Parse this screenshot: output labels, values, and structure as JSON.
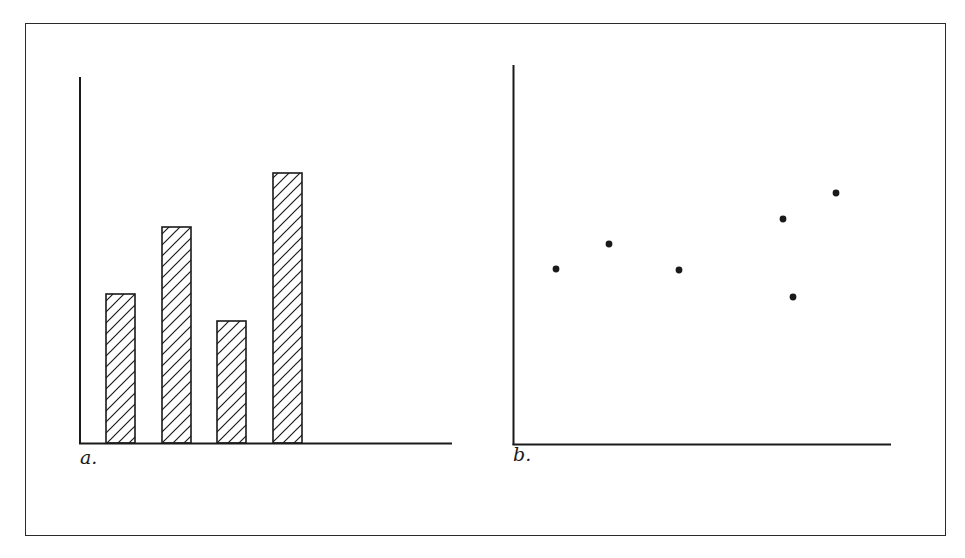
{
  "figure": {
    "panels": [
      {
        "id": "a",
        "label": "a."
      },
      {
        "id": "b",
        "label": "b."
      }
    ]
  },
  "chart_data": [
    {
      "type": "bar",
      "panel": "a.",
      "title": "",
      "xlabel": "",
      "ylabel": "",
      "categories": [
        "1",
        "2",
        "3",
        "4"
      ],
      "values": [
        149,
        216,
        122,
        270
      ],
      "units": "relative height (no axis ticks or labels shown)",
      "fill": "diagonal hatch",
      "grid": false,
      "legend": null
    },
    {
      "type": "scatter",
      "panel": "b.",
      "title": "",
      "xlabel": "",
      "ylabel": "",
      "points": [
        {
          "x": 43,
          "y": 175
        },
        {
          "x": 96,
          "y": 200
        },
        {
          "x": 166,
          "y": 174
        },
        {
          "x": 270,
          "y": 225
        },
        {
          "x": 280,
          "y": 147
        },
        {
          "x": 323,
          "y": 251
        }
      ],
      "units": "relative position (no axis ticks or labels shown)",
      "grid": false,
      "legend": null
    }
  ],
  "style": {
    "ink": "#1a1a1a",
    "background": "#ffffff"
  }
}
